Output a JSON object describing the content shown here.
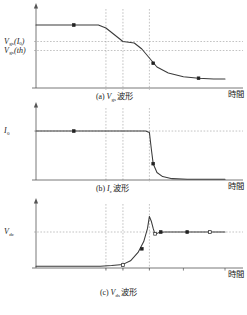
{
  "figure": {
    "axis_time_label": "時間",
    "panels": [
      {
        "id": "a",
        "caption_index": "(a)",
        "caption_symbol": "V",
        "caption_sub": "gs",
        "caption_word": "波形",
        "ylabels": [
          {
            "main": "V",
            "sub": "gs",
            "paren": "(I",
            "paren_sub": "0",
            "paren_end": ")"
          },
          {
            "main": "V",
            "sub": "gs",
            "paren": "(th)",
            "paren_sub": "",
            "paren_end": ""
          }
        ]
      },
      {
        "id": "b",
        "caption_index": "(b)",
        "caption_symbol": "I",
        "caption_sub": "c",
        "caption_word": "波形",
        "ylabels": [
          {
            "main": "I",
            "sub": "0",
            "paren": "",
            "paren_sub": "",
            "paren_end": ""
          }
        ]
      },
      {
        "id": "c",
        "caption_index": "(c)",
        "caption_symbol": "V",
        "caption_sub": "ds",
        "caption_word": "波形",
        "ylabels": [
          {
            "main": "V",
            "sub": "dc",
            "paren": "",
            "paren_sub": "",
            "paren_end": ""
          }
        ],
        "xticks": [
          {
            "main": "t",
            "sub": "5"
          },
          {
            "main": "t",
            "sub": "6"
          },
          {
            "main": "t",
            "sub": "7"
          }
        ]
      }
    ],
    "colors": {
      "curve": "#3a3a3a",
      "axis": "#555555",
      "guide": "#9a9a9a",
      "marker_fill": "#222222",
      "marker_open": "#ffffff",
      "background": "#ffffff"
    }
  },
  "chart_data": [
    {
      "type": "line",
      "title": "(a) Vgs 波形",
      "xlabel": "時間",
      "ylabel": "Vgs",
      "xlim": [
        0,
        100
      ],
      "ylim": [
        0,
        100
      ],
      "grid": false,
      "legend": "none",
      "yticks": [
        {
          "label": "Vgs(I0)",
          "value": 62
        },
        {
          "label": "Vgs(th)",
          "value": 50
        }
      ],
      "vlines": [
        37,
        46,
        60
      ],
      "series": [
        {
          "name": "Vgs",
          "x": [
            0,
            20,
            33,
            37,
            46,
            52,
            56,
            60,
            64,
            70,
            78,
            86,
            94,
            100
          ],
          "values": [
            84,
            84,
            84,
            80,
            62,
            60,
            52,
            40,
            28,
            20,
            15,
            13,
            12,
            12
          ]
        }
      ],
      "markers": [
        {
          "x": 20,
          "y": 84,
          "style": "filled-square"
        },
        {
          "x": 62,
          "y": 33,
          "style": "filled-square"
        },
        {
          "x": 86,
          "y": 13,
          "style": "filled-square"
        }
      ]
    },
    {
      "type": "line",
      "title": "(b) Ic 波形",
      "xlabel": "時間",
      "ylabel": "Ic",
      "xlim": [
        0,
        100
      ],
      "ylim": [
        0,
        100
      ],
      "grid": false,
      "legend": "none",
      "yticks": [
        {
          "label": "I0",
          "value": 72
        }
      ],
      "vlines": [
        37,
        46,
        60
      ],
      "series": [
        {
          "name": "Ic",
          "x": [
            0,
            20,
            40,
            58,
            60,
            61,
            62,
            64,
            67,
            72,
            80,
            100
          ],
          "values": [
            72,
            72,
            72,
            72,
            70,
            46,
            24,
            11,
            5,
            2,
            1,
            1
          ]
        }
      ],
      "markers": [
        {
          "x": 20,
          "y": 72,
          "style": "filled-square"
        },
        {
          "x": 62,
          "y": 24,
          "style": "filled-square"
        }
      ]
    },
    {
      "type": "line",
      "title": "(c) Vds 波形",
      "xlabel": "時間",
      "ylabel": "Vds",
      "xlim": [
        0,
        100
      ],
      "ylim": [
        0,
        100
      ],
      "grid": false,
      "legend": "none",
      "yticks": [
        {
          "label": "Vdc",
          "value": 60
        }
      ],
      "vlines": [
        37,
        46,
        60
      ],
      "xticks": [
        {
          "label": "t5",
          "value": 37
        },
        {
          "label": "t6",
          "value": 46
        },
        {
          "label": "t7",
          "value": 60
        }
      ],
      "series": [
        {
          "name": "Vds",
          "x": [
            0,
            20,
            34,
            40,
            46,
            50,
            54,
            57,
            59,
            60,
            61,
            62,
            63,
            65,
            68,
            72,
            78,
            92,
            100
          ],
          "values": [
            3,
            3,
            3,
            4,
            6,
            12,
            26,
            44,
            66,
            86,
            78,
            66,
            56,
            59,
            60,
            60,
            60,
            60,
            60
          ]
        }
      ],
      "markers": [
        {
          "x": 46,
          "y": 5,
          "style": "open-square"
        },
        {
          "x": 56,
          "y": 32,
          "style": "filled-square"
        },
        {
          "x": 63,
          "y": 57,
          "style": "open-square"
        },
        {
          "x": 66,
          "y": 60,
          "style": "filled-square"
        },
        {
          "x": 80,
          "y": 60,
          "style": "filled-square"
        },
        {
          "x": 92,
          "y": 60,
          "style": "open-square"
        }
      ]
    }
  ]
}
